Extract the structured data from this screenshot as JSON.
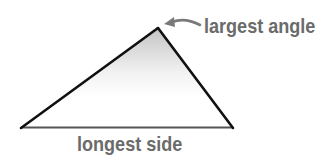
{
  "diagram": {
    "type": "triangle",
    "vertices": {
      "left": [
        21,
        128
      ],
      "top": [
        158,
        28
      ],
      "right": [
        233,
        128
      ]
    },
    "labels": {
      "largest_angle": "largest angle",
      "longest_side": "longest side"
    },
    "colors": {
      "edge": "#111111",
      "base_edge": "#555555",
      "label": "#6b6b6b",
      "arrow": "#7a7a7a",
      "shade": "#c8c8c8"
    }
  }
}
